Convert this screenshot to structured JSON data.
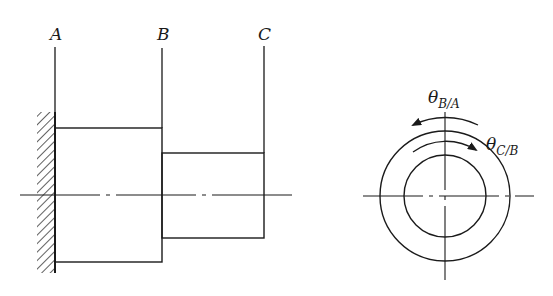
{
  "figure": {
    "side_view": {
      "labels": {
        "a": "A",
        "b": "B",
        "c": "C"
      },
      "support": "fixed-wall-hatched"
    },
    "end_view": {
      "angle_labels": {
        "theta_ba_symbol": "θ",
        "theta_ba_subscript": "B/A",
        "theta_cb_symbol": "θ",
        "theta_cb_subscript": "C/B"
      }
    },
    "colors": {
      "ink": "#1a1a1a",
      "background": "#ffffff"
    }
  }
}
